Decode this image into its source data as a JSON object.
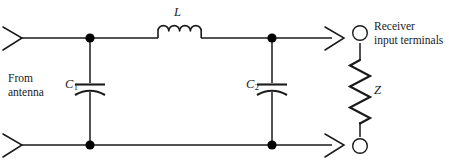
{
  "figure": {
    "background_color": "#ffffff",
    "line_color": "#1a1a1a",
    "node_color": "#000000"
  },
  "labels": {
    "from_antenna_line1": "From",
    "from_antenna_line2": "antenna",
    "receiver_line1": "Receiver",
    "receiver_line2": "input terminals",
    "inductor": "L",
    "capacitor1": "C",
    "capacitor1_sub": "1",
    "capacitor2": "C",
    "capacitor2_sub": "2",
    "impedance": "Z"
  },
  "components": {
    "inductor": {
      "name": "L",
      "type": "inductor",
      "coil_count": 4,
      "orientation": "horizontal"
    },
    "capacitor1": {
      "name": "C1",
      "type": "capacitor-polarized",
      "orientation": "vertical"
    },
    "capacitor2": {
      "name": "C2",
      "type": "capacitor-polarized",
      "orientation": "vertical"
    },
    "impedance": {
      "name": "Z",
      "type": "resistor-zigzag",
      "orientation": "vertical",
      "zigzag_segments": 6
    }
  },
  "terminals": {
    "top_terminal": "open-circle",
    "bottom_terminal": "open-circle"
  },
  "nodes": [
    {
      "name": "node-top-left",
      "x": 90,
      "y": 38
    },
    {
      "name": "node-top-right",
      "x": 272,
      "y": 38
    },
    {
      "name": "node-bottom-left",
      "x": 90,
      "y": 145
    },
    {
      "name": "node-bottom-right",
      "x": 272,
      "y": 145
    }
  ]
}
